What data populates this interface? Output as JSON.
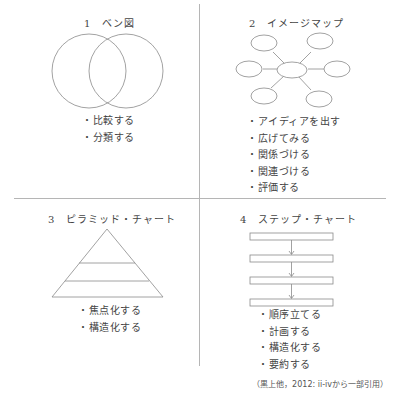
{
  "quadrants": [
    {
      "number": "1",
      "title": "1　ベン図",
      "diagram": "venn",
      "items": [
        "・比較する",
        "・分類する"
      ]
    },
    {
      "number": "2",
      "title": "2　イメージマップ",
      "diagram": "image-map",
      "items": [
        "・アイディアを出す",
        "・広げてみる",
        "・関係づける",
        "・関連づける",
        "・評価する"
      ]
    },
    {
      "number": "3",
      "title": "3　ピラミッド・チャート",
      "diagram": "pyramid",
      "items": [
        "・焦点化する",
        "・構造化する"
      ]
    },
    {
      "number": "4",
      "title": "4　ステップ・チャート",
      "diagram": "step-chart",
      "items": [
        "・順序立てる",
        "・計画する",
        "・構造化する",
        "・要約する"
      ]
    }
  ],
  "citation": "（黒上他，2012: ii-ivから一部引用）",
  "colors": {
    "line": "#8a8a8a",
    "divider": "#b5b5b5",
    "text": "#444444"
  }
}
